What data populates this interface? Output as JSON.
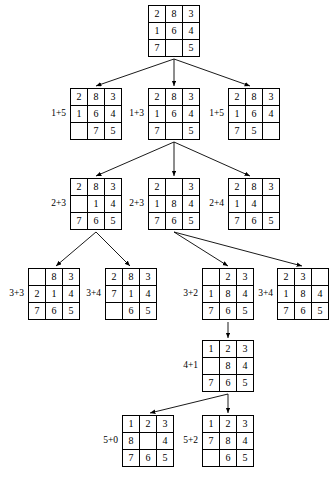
{
  "diagram": {
    "background_color": "#ffffff",
    "line_color": "#000000",
    "text_color": "#000000",
    "blank_tile": ""
  },
  "nodes": [
    {
      "id": "root",
      "cost_label": "",
      "x": 148,
      "y": 5,
      "rows": [
        [
          "2",
          "8",
          "3"
        ],
        [
          "1",
          "6",
          "4"
        ],
        [
          "7",
          "",
          "5"
        ]
      ]
    },
    {
      "id": "n1a",
      "cost_label": "1+5",
      "x": 70,
      "y": 88,
      "rows": [
        [
          "2",
          "8",
          "3"
        ],
        [
          "1",
          "6",
          "4"
        ],
        [
          "",
          "7",
          "5"
        ]
      ]
    },
    {
      "id": "n1b",
      "cost_label": "1+3",
      "x": 148,
      "y": 88,
      "rows": [
        [
          "2",
          "8",
          "3"
        ],
        [
          "1",
          "6",
          "4"
        ],
        [
          "7",
          "",
          "5"
        ]
      ]
    },
    {
      "id": "n1c",
      "cost_label": "1+5",
      "x": 228,
      "y": 88,
      "rows": [
        [
          "2",
          "8",
          "3"
        ],
        [
          "1",
          "6",
          "4"
        ],
        [
          "7",
          "5",
          ""
        ]
      ]
    },
    {
      "id": "n2a",
      "cost_label": "2+3",
      "x": 70,
      "y": 178,
      "rows": [
        [
          "2",
          "8",
          "3"
        ],
        [
          "",
          "1",
          "4"
        ],
        [
          "7",
          "6",
          "5"
        ]
      ]
    },
    {
      "id": "n2b",
      "cost_label": "2+3",
      "x": 148,
      "y": 178,
      "rows": [
        [
          "2",
          "",
          "3"
        ],
        [
          "1",
          "8",
          "4"
        ],
        [
          "7",
          "6",
          "5"
        ]
      ]
    },
    {
      "id": "n2c",
      "cost_label": "2+4",
      "x": 228,
      "y": 178,
      "rows": [
        [
          "2",
          "8",
          "3"
        ],
        [
          "1",
          "4",
          ""
        ],
        [
          "7",
          "6",
          "5"
        ]
      ]
    },
    {
      "id": "n3a",
      "cost_label": "3+3",
      "x": 28,
      "y": 268,
      "rows": [
        [
          "",
          "8",
          "3"
        ],
        [
          "2",
          "1",
          "4"
        ],
        [
          "7",
          "6",
          "5"
        ]
      ]
    },
    {
      "id": "n3b",
      "cost_label": "3+4",
      "x": 105,
      "y": 268,
      "rows": [
        [
          "2",
          "8",
          "3"
        ],
        [
          "7",
          "1",
          "4"
        ],
        [
          "",
          "6",
          "5"
        ]
      ]
    },
    {
      "id": "n3c",
      "cost_label": "3+2",
      "x": 202,
      "y": 268,
      "rows": [
        [
          "",
          "2",
          "3"
        ],
        [
          "1",
          "8",
          "4"
        ],
        [
          "7",
          "6",
          "5"
        ]
      ]
    },
    {
      "id": "n3d",
      "cost_label": "3+4",
      "x": 277,
      "y": 268,
      "rows": [
        [
          "2",
          "3",
          ""
        ],
        [
          "1",
          "8",
          "4"
        ],
        [
          "7",
          "6",
          "5"
        ]
      ]
    },
    {
      "id": "n4a",
      "cost_label": "4+1",
      "x": 202,
      "y": 340,
      "rows": [
        [
          "1",
          "2",
          "3"
        ],
        [
          "",
          "8",
          "4"
        ],
        [
          "7",
          "6",
          "5"
        ]
      ]
    },
    {
      "id": "n5a",
      "cost_label": "5+0",
      "x": 122,
      "y": 415,
      "rows": [
        [
          "1",
          "2",
          "3"
        ],
        [
          "8",
          "",
          "4"
        ],
        [
          "7",
          "6",
          "5"
        ]
      ]
    },
    {
      "id": "n5b",
      "cost_label": "5+2",
      "x": 202,
      "y": 415,
      "rows": [
        [
          "1",
          "2",
          "3"
        ],
        [
          "7",
          "8",
          "4"
        ],
        [
          "",
          "6",
          "5"
        ]
      ]
    }
  ],
  "edges": [
    {
      "from": "root",
      "to": "n1a",
      "x1": 174,
      "y1": 59,
      "x2": 96,
      "y2": 86
    },
    {
      "from": "root",
      "to": "n1b",
      "x1": 174,
      "y1": 59,
      "x2": 174,
      "y2": 86
    },
    {
      "from": "root",
      "to": "n1c",
      "x1": 174,
      "y1": 59,
      "x2": 250,
      "y2": 86
    },
    {
      "from": "n1b",
      "to": "n2a",
      "x1": 174,
      "y1": 142,
      "x2": 96,
      "y2": 176
    },
    {
      "from": "n1b",
      "to": "n2b",
      "x1": 174,
      "y1": 142,
      "x2": 174,
      "y2": 176
    },
    {
      "from": "n1b",
      "to": "n2c",
      "x1": 174,
      "y1": 142,
      "x2": 250,
      "y2": 176
    },
    {
      "from": "n2a",
      "to": "n3a",
      "x1": 96,
      "y1": 232,
      "x2": 56,
      "y2": 266
    },
    {
      "from": "n2a",
      "to": "n3b",
      "x1": 96,
      "y1": 232,
      "x2": 130,
      "y2": 266
    },
    {
      "from": "n2b",
      "to": "n3c",
      "x1": 174,
      "y1": 232,
      "x2": 228,
      "y2": 266
    },
    {
      "from": "n2b",
      "to": "n3d",
      "x1": 174,
      "y1": 232,
      "x2": 302,
      "y2": 266
    },
    {
      "from": "n3c",
      "to": "n4a",
      "x1": 228,
      "y1": 322,
      "x2": 228,
      "y2": 338
    },
    {
      "from": "n4a",
      "to": "n5a",
      "x1": 228,
      "y1": 394,
      "x2": 150,
      "y2": 413
    },
    {
      "from": "n4a",
      "to": "n5b",
      "x1": 228,
      "y1": 394,
      "x2": 228,
      "y2": 413
    }
  ]
}
